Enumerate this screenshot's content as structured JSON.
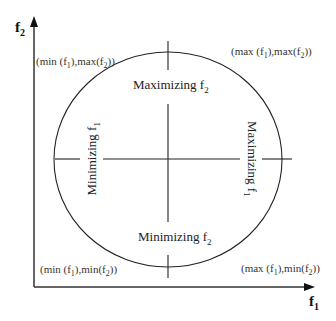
{
  "axes": {
    "y_label": {
      "base": "f",
      "sub": "2"
    },
    "x_label": {
      "base": "f",
      "sub": "1"
    }
  },
  "corners": {
    "top_left": {
      "pre": "(min (f",
      "s1": "1",
      "mid": "),max(f",
      "s2": "2",
      "post": "))"
    },
    "top_right": {
      "pre": "(max (f",
      "s1": "1",
      "mid": "),max(f",
      "s2": "2",
      "post": "))"
    },
    "bottom_left": {
      "pre": "(min (f",
      "s1": "1",
      "mid": "),min(f",
      "s2": "2",
      "post": "))"
    },
    "bottom_right": {
      "pre": "(max (f",
      "s1": "1",
      "mid": "),min(f",
      "s2": "2",
      "post": "))"
    }
  },
  "directions": {
    "top": {
      "text": "Maximizing f",
      "sub": "2"
    },
    "bottom": {
      "text": "Minimizing f",
      "sub": "2"
    },
    "left": {
      "text": "Minimizing f",
      "sub": "1"
    },
    "right": {
      "text": "Maximizing f",
      "sub": "1"
    }
  },
  "colors": {
    "line": "#222222",
    "background": "#ffffff"
  }
}
